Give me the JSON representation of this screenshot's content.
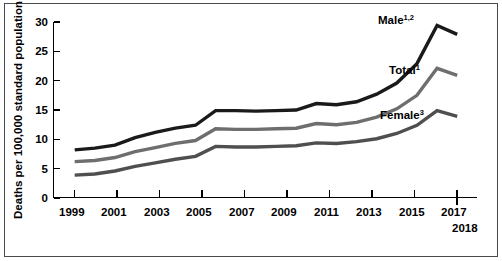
{
  "chart_data": {
    "type": "line",
    "title": "",
    "subtitle": "",
    "xlabel": "",
    "ylabel": "Deaths per 100,000 standard population",
    "xlim": [
      1999,
      2018
    ],
    "ylim": [
      0,
      30
    ],
    "grid": false,
    "legend_position": "inline-right-end-labels",
    "x": [
      1999,
      2000,
      2001,
      2002,
      2003,
      2004,
      2005,
      2006,
      2007,
      2008,
      2009,
      2010,
      2011,
      2012,
      2013,
      2014,
      2015,
      2016,
      2017,
      2018
    ],
    "xticks": [
      "1999",
      "2001",
      "2003",
      "2005",
      "2007",
      "2009",
      "2011",
      "2013",
      "2015",
      "2017"
    ],
    "xtick_values": [
      1999,
      2001,
      2003,
      2005,
      2007,
      2009,
      2011,
      2013,
      2015,
      2017
    ],
    "end_tick_label": "2018",
    "yticks": [
      "0",
      "5",
      "10",
      "15",
      "20",
      "25",
      "30"
    ],
    "ytick_values": [
      0,
      5,
      10,
      15,
      20,
      25,
      30
    ],
    "series": [
      {
        "name": "Male",
        "label": "Male",
        "superscript": "1,2",
        "color": "#1a1a1a",
        "width": 3.4,
        "values": [
          8.2,
          8.5,
          9.0,
          10.3,
          11.2,
          11.9,
          12.4,
          14.9,
          14.9,
          14.8,
          14.9,
          15.0,
          16.1,
          15.9,
          16.4,
          17.7,
          19.6,
          22.9,
          29.4,
          27.9
        ]
      },
      {
        "name": "Total",
        "label": "Total",
        "superscript": "1",
        "color": "#6e6e6e",
        "width": 3.4,
        "values": [
          6.2,
          6.4,
          6.9,
          7.9,
          8.6,
          9.3,
          9.8,
          11.8,
          11.7,
          11.7,
          11.8,
          11.9,
          12.7,
          12.5,
          12.9,
          13.8,
          15.2,
          17.5,
          22.1,
          20.9
        ]
      },
      {
        "name": "Female",
        "label": "Female",
        "superscript": "3",
        "color": "#4f4f4f",
        "width": 3.4,
        "values": [
          3.9,
          4.1,
          4.6,
          5.4,
          6.0,
          6.6,
          7.1,
          8.8,
          8.7,
          8.7,
          8.8,
          8.9,
          9.4,
          9.3,
          9.6,
          10.1,
          11.0,
          12.4,
          14.9,
          13.9
        ]
      }
    ],
    "annotations": [
      {
        "text": "Male",
        "superscript": "1,2",
        "x_px": 378,
        "y_px": 24
      },
      {
        "text": "Total",
        "superscript": "1",
        "x_px": 389,
        "y_px": 74
      },
      {
        "text": "Female",
        "superscript": "3",
        "x_px": 380,
        "y_px": 119
      }
    ]
  },
  "axes": {
    "y_title": "Deaths per 100,000 standard population"
  }
}
